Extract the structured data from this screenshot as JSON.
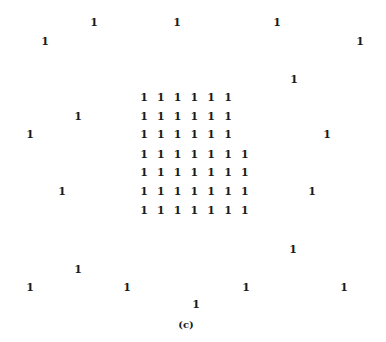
{
  "figure": {
    "caption": "(c)",
    "cell_value": "1",
    "grid": {
      "rows": [
        {
          "y": 98,
          "cols": 6
        },
        {
          "y": 117,
          "cols": 6
        },
        {
          "y": 135,
          "cols": 6
        },
        {
          "y": 155,
          "cols": 7
        },
        {
          "y": 173,
          "cols": 7
        },
        {
          "y": 192,
          "cols": 7
        },
        {
          "y": 211,
          "cols": 7
        }
      ],
      "x_start": 144,
      "x_step": 16.8
    },
    "scattered": [
      {
        "x": 94,
        "y": 23,
        "value": "1"
      },
      {
        "x": 177,
        "y": 23,
        "value": "1"
      },
      {
        "x": 277,
        "y": 23,
        "value": "1"
      },
      {
        "x": 45,
        "y": 42,
        "value": "1"
      },
      {
        "x": 360,
        "y": 42,
        "value": "1"
      },
      {
        "x": 294,
        "y": 80,
        "value": "1"
      },
      {
        "x": 78,
        "y": 117,
        "value": "1"
      },
      {
        "x": 30,
        "y": 135,
        "value": "1"
      },
      {
        "x": 327,
        "y": 135,
        "value": "1"
      },
      {
        "x": 62,
        "y": 192,
        "value": "1"
      },
      {
        "x": 312,
        "y": 192,
        "value": "1"
      },
      {
        "x": 293,
        "y": 250,
        "value": "1"
      },
      {
        "x": 78,
        "y": 270,
        "value": "1"
      },
      {
        "x": 30,
        "y": 288,
        "value": "1"
      },
      {
        "x": 127,
        "y": 288,
        "value": "1"
      },
      {
        "x": 246,
        "y": 288,
        "value": "1"
      },
      {
        "x": 344,
        "y": 288,
        "value": "1"
      },
      {
        "x": 196,
        "y": 305,
        "value": "1"
      }
    ],
    "caption_pos": {
      "x": 186,
      "y": 325
    }
  }
}
